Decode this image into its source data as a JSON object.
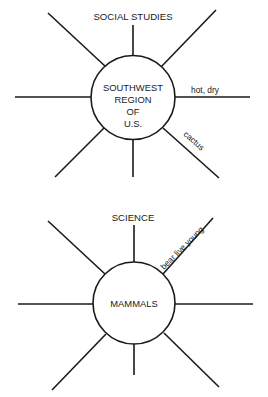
{
  "colors": {
    "line": "#1a1a1a",
    "background": "#ffffff"
  },
  "webs": [
    {
      "subject": "SOCIAL STUDIES",
      "topic_lines": [
        "SOUTHWEST",
        "REGION",
        "OF",
        "U.S."
      ],
      "spoke_labels": {
        "right": "hot, dry",
        "lower_right": "cactus"
      }
    },
    {
      "subject": "SCIENCE",
      "topic_lines": [
        "MAMMALS"
      ],
      "spoke_labels": {
        "upper_right": "bear live young"
      }
    }
  ]
}
